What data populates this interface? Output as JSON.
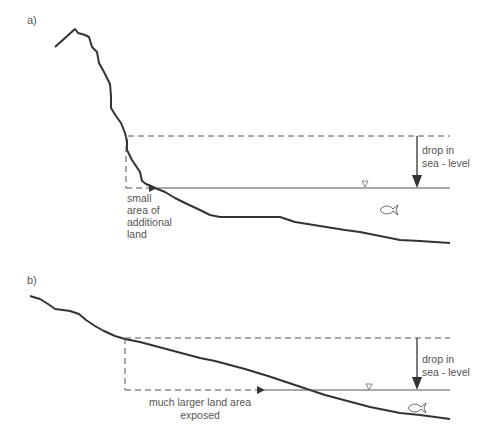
{
  "figure": {
    "colors": {
      "profile": "#333333",
      "lines": "#444444",
      "text": "#555555",
      "background": "#ffffff"
    }
  },
  "panel_a": {
    "label": "a)",
    "drop_label_line1": "drop in",
    "drop_label_line2": "sea - level",
    "land_label_line1": "small",
    "land_label_line2": "area of",
    "land_label_line3": "additional",
    "land_label_line4": "land",
    "water_level_icon": "water-level-triangle",
    "marine_icon": "fish"
  },
  "panel_b": {
    "label": "b)",
    "drop_label_line1": "drop in",
    "drop_label_line2": "sea - level",
    "land_label_line1": "much larger land area",
    "land_label_line2": "exposed",
    "water_level_icon": "water-level-triangle",
    "marine_icon": "fish"
  }
}
